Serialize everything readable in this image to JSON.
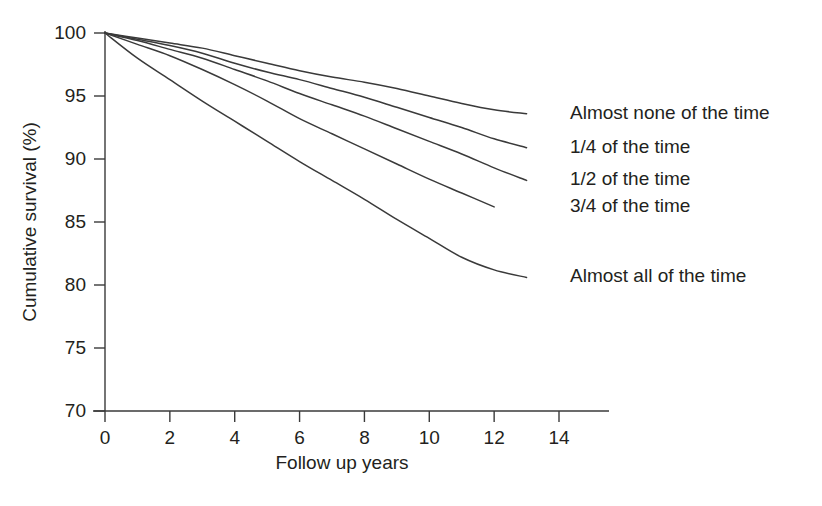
{
  "chart_data": {
    "type": "line",
    "title": "",
    "subtitle": "",
    "xlabel": "Follow up years",
    "ylabel": "Cumulative survival (%)",
    "xlim": [
      0,
      14
    ],
    "ylim": [
      70,
      100
    ],
    "xticks": [
      0,
      2,
      4,
      6,
      8,
      10,
      12,
      14
    ],
    "xticklabels": [
      "0",
      "2",
      "4",
      "6",
      "8",
      "10",
      "12",
      "14"
    ],
    "yticks": [
      70,
      75,
      80,
      85,
      90,
      95,
      100
    ],
    "yticklabels": [
      "70",
      "75",
      "80",
      "85",
      "90",
      "95",
      "100"
    ],
    "grid": false,
    "legend_position": "right-of-curve-ends",
    "annotations": [
      "Almost none of the time",
      "1/4 of the time",
      "1/2 of the time",
      "3/4 of the time",
      "Almost all of the time"
    ],
    "series": [
      {
        "name": "Almost none of the time",
        "label": "Almost none of the time",
        "label_y": 93.6,
        "x": [
          0,
          1,
          2,
          3,
          4,
          5,
          6,
          7,
          8,
          9,
          10,
          11,
          12,
          13
        ],
        "values": [
          100,
          99.6,
          99.2,
          98.8,
          98.2,
          97.6,
          97.0,
          96.5,
          96.1,
          95.6,
          95.0,
          94.4,
          93.9,
          93.6
        ]
      },
      {
        "name": "1/4 of the time",
        "label": "1/4 of the time",
        "label_y": 90.9,
        "x": [
          0,
          1,
          2,
          3,
          4,
          5,
          6,
          7,
          8,
          9,
          10,
          11,
          12,
          13
        ],
        "values": [
          100,
          99.5,
          99.0,
          98.4,
          97.6,
          96.9,
          96.3,
          95.6,
          94.9,
          94.1,
          93.3,
          92.5,
          91.6,
          90.9
        ]
      },
      {
        "name": "1/2 of the time",
        "label": "1/2 of the time",
        "label_y": 88.3,
        "x": [
          0,
          1,
          2,
          3,
          4,
          5,
          6,
          7,
          8,
          9,
          10,
          11,
          12,
          13
        ],
        "values": [
          100,
          99.4,
          98.7,
          98.0,
          97.1,
          96.2,
          95.2,
          94.3,
          93.4,
          92.4,
          91.4,
          90.4,
          89.3,
          88.3
        ]
      },
      {
        "name": "3/4 of the time",
        "label": "3/4 of the time",
        "label_y": 86.2,
        "x": [
          0,
          1,
          2,
          3,
          4,
          5,
          6,
          7,
          8,
          9,
          10,
          11,
          12
        ],
        "values": [
          100,
          99.1,
          98.2,
          97.1,
          95.9,
          94.6,
          93.2,
          92.0,
          90.8,
          89.6,
          88.4,
          87.3,
          86.2
        ]
      },
      {
        "name": "Almost all of the time",
        "label": "Almost all of the time",
        "label_y": 80.6,
        "x": [
          0,
          1,
          2,
          3,
          4,
          5,
          6,
          7,
          8,
          9,
          10,
          11,
          12,
          13
        ],
        "values": [
          100,
          98.0,
          96.3,
          94.6,
          93.0,
          91.4,
          89.8,
          88.3,
          86.8,
          85.2,
          83.7,
          82.2,
          81.2,
          80.6
        ]
      }
    ]
  }
}
